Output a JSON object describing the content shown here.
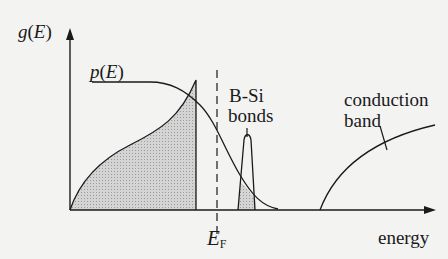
{
  "diagram": {
    "axes": {
      "y_label": {
        "func": "g",
        "arg": "E"
      },
      "x_label": "energy"
    },
    "labels": {
      "occupation": {
        "func": "p",
        "arg": "E"
      },
      "fermi": {
        "symbol": "E",
        "subscript": "F"
      },
      "bsi_line1": "B-Si",
      "bsi_line2": "bonds",
      "cb_line1": "conduction",
      "cb_line2": "band"
    },
    "colors": {
      "line": "#1a1a1a",
      "fill": "#c8c8c8",
      "background": "#f3f3f2"
    }
  }
}
